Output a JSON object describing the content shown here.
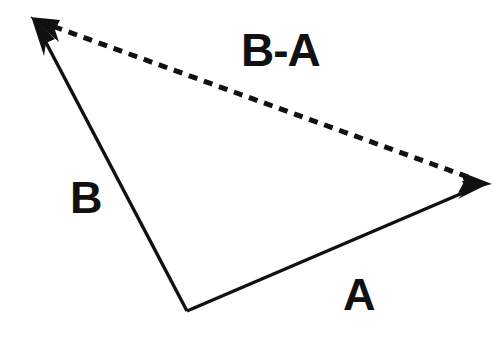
{
  "figure": {
    "background_color": "#ffffff",
    "stroke_color": "#111111",
    "labels": {
      "vector_a": "A",
      "vector_b": "B",
      "vector_b_minus_a": "B-A"
    },
    "geometry": {
      "origin": {
        "x": 187,
        "y": 311
      },
      "tip_a": {
        "x": 488,
        "y": 182
      },
      "tip_b": {
        "x": 33,
        "y": 18
      }
    },
    "vectors": [
      {
        "name": "A",
        "label": "A",
        "style": "solid",
        "from": {
          "x": 187,
          "y": 311
        },
        "to": {
          "x": 488,
          "y": 182
        },
        "arrowhead": "filled-triangle",
        "stroke_width": 3
      },
      {
        "name": "B",
        "label": "B",
        "style": "solid",
        "from": {
          "x": 187,
          "y": 311
        },
        "to": {
          "x": 33,
          "y": 18
        },
        "arrowhead": "filled-triangle",
        "stroke_width": 3
      },
      {
        "name": "B-A",
        "label": "B-A",
        "style": "dashed",
        "from": {
          "x": 480,
          "y": 180
        },
        "to": {
          "x": 42,
          "y": 22
        },
        "arrowhead": "filled-triangle-both-ends",
        "stroke_width": 5,
        "dash_length": 9,
        "dash_gap": 7
      }
    ]
  }
}
